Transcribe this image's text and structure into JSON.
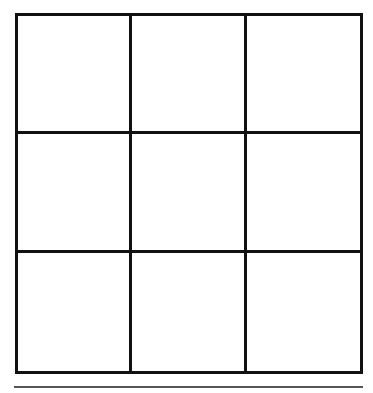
{
  "board": {
    "rows": 3,
    "cols": 3,
    "line_color": "#111111",
    "cells": [
      [
        "",
        "",
        ""
      ],
      [
        "",
        "",
        ""
      ],
      [
        "",
        "",
        ""
      ]
    ]
  },
  "separator": {
    "color": "#555555"
  }
}
